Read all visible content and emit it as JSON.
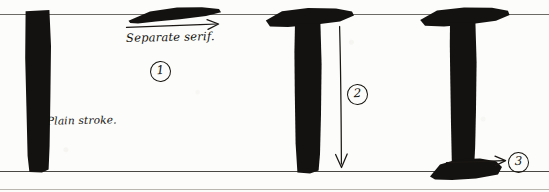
{
  "figure": {
    "medium": "pen-and-ink handwritten lettering exercise",
    "ink_color": "#141210",
    "paper_color": "#fcfcfa",
    "rule_color": "#6d6b66"
  },
  "guidelines": [
    {
      "name": "cap-line",
      "y": 14
    },
    {
      "name": "base-line",
      "y": 171
    },
    {
      "name": "lower-rule",
      "y": 189
    }
  ],
  "annotations": [
    {
      "id": "separate-serif",
      "text": "Separate serif.",
      "x": 126,
      "y": 30
    },
    {
      "id": "plain-stroke",
      "text": "Plain stroke.",
      "x": 47,
      "y": 114
    }
  ],
  "steps": [
    {
      "number": "1",
      "label": "Separate serif stroke",
      "x": 150,
      "y": 61
    },
    {
      "number": "2",
      "label": "Vertical stem pulled downward",
      "x": 347,
      "y": 84
    },
    {
      "number": "3",
      "label": "Foot serif added at baseline",
      "x": 508,
      "y": 152
    }
  ],
  "strokes": [
    {
      "id": "plain-stem",
      "caption": "Plain stroke.",
      "has_top_serif": false,
      "has_foot_serif": false,
      "x": 24,
      "y": 10,
      "width": 25,
      "height": 161
    },
    {
      "id": "detached-serif-mark",
      "caption": "Separate serif.",
      "has_top_serif": true,
      "has_foot_serif": false,
      "x": 127,
      "y": 8,
      "width": 93,
      "height": 14
    },
    {
      "id": "serif-tee-no-foot",
      "caption": "Top serif joined to stem",
      "has_top_serif": true,
      "has_foot_serif": false,
      "x": 266,
      "y": 8,
      "width": 88,
      "height": 163
    },
    {
      "id": "serif-tee-with-foot",
      "caption": "Top serif and foot serif",
      "has_top_serif": true,
      "has_foot_serif": true,
      "x": 416,
      "y": 8,
      "width": 96,
      "height": 171
    }
  ],
  "arrows": [
    {
      "id": "arrow-serif",
      "direction": "right",
      "x": 128,
      "y": 24,
      "length": 92
    },
    {
      "id": "arrow-stem",
      "direction": "down",
      "x": 340,
      "y": 28,
      "length": 142
    },
    {
      "id": "arrow-foot",
      "direction": "right",
      "x": 448,
      "y": 160,
      "length": 58
    }
  ]
}
